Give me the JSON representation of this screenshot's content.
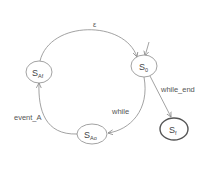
{
  "diagram": {
    "type": "state-machine",
    "states": [
      {
        "id": "S_Af",
        "label": "S",
        "subscript": "Af",
        "final": false
      },
      {
        "id": "S_0",
        "label": "S",
        "subscript": "0",
        "final": false,
        "initial": true
      },
      {
        "id": "S_Ao",
        "label": "S",
        "subscript": "Ao",
        "final": false
      },
      {
        "id": "S_f",
        "label": "S",
        "subscript": "f",
        "final": true
      }
    ],
    "transitions": [
      {
        "from": "S_Af",
        "to": "S_0",
        "label": "ε"
      },
      {
        "from": "S_0",
        "to": "S_Ao",
        "label": "while"
      },
      {
        "from": "S_Ao",
        "to": "S_Af",
        "label": "event_A"
      },
      {
        "from": "S_0",
        "to": "S_f",
        "label": "while_end"
      }
    ]
  },
  "labels": {
    "epsilon": "ε",
    "while": "while",
    "event_a": "event_A",
    "while_end": "while_end"
  },
  "colors": {
    "stroke": "#8a8a8a",
    "final_stroke": "#555555",
    "text": "#555555"
  }
}
